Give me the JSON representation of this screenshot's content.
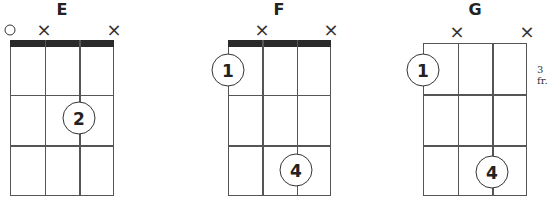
{
  "chords": [
    {
      "name": "E",
      "title_x": 62,
      "grid": {
        "left": 10,
        "right": 114,
        "top": 40,
        "bottom": 196
      },
      "has_nut": true,
      "string_markers": [
        {
          "type": "open",
          "symbol": "○",
          "x": 10,
          "y": 30
        },
        {
          "type": "muted",
          "symbol": "×",
          "x": 44,
          "y": 30
        },
        {
          "type": "muted",
          "symbol": "×",
          "x": 114,
          "y": 30
        }
      ],
      "fingers": [
        {
          "label": "2",
          "x": 79,
          "y": 118
        }
      ],
      "fret_label": null
    },
    {
      "name": "F",
      "title_x": 279,
      "grid": {
        "left": 228,
        "right": 331,
        "top": 40,
        "bottom": 196
      },
      "has_nut": true,
      "string_markers": [
        {
          "type": "muted",
          "symbol": "×",
          "x": 262,
          "y": 30
        },
        {
          "type": "muted",
          "symbol": "×",
          "x": 331,
          "y": 30
        }
      ],
      "fingers": [
        {
          "label": "1",
          "x": 228,
          "y": 70
        },
        {
          "label": "4",
          "x": 296,
          "y": 170
        }
      ],
      "fret_label": null
    },
    {
      "name": "G",
      "title_x": 475,
      "grid": {
        "left": 423,
        "right": 527,
        "top": 43,
        "bottom": 196
      },
      "has_nut": false,
      "string_markers": [
        {
          "type": "muted",
          "symbol": "×",
          "x": 457,
          "y": 32
        },
        {
          "type": "muted",
          "symbol": "×",
          "x": 527,
          "y": 32
        }
      ],
      "fingers": [
        {
          "label": "1",
          "x": 423,
          "y": 70
        },
        {
          "label": "4",
          "x": 492,
          "y": 172
        }
      ],
      "fret_label": {
        "text": "3 fr.",
        "x": 537,
        "y": 64
      }
    }
  ]
}
